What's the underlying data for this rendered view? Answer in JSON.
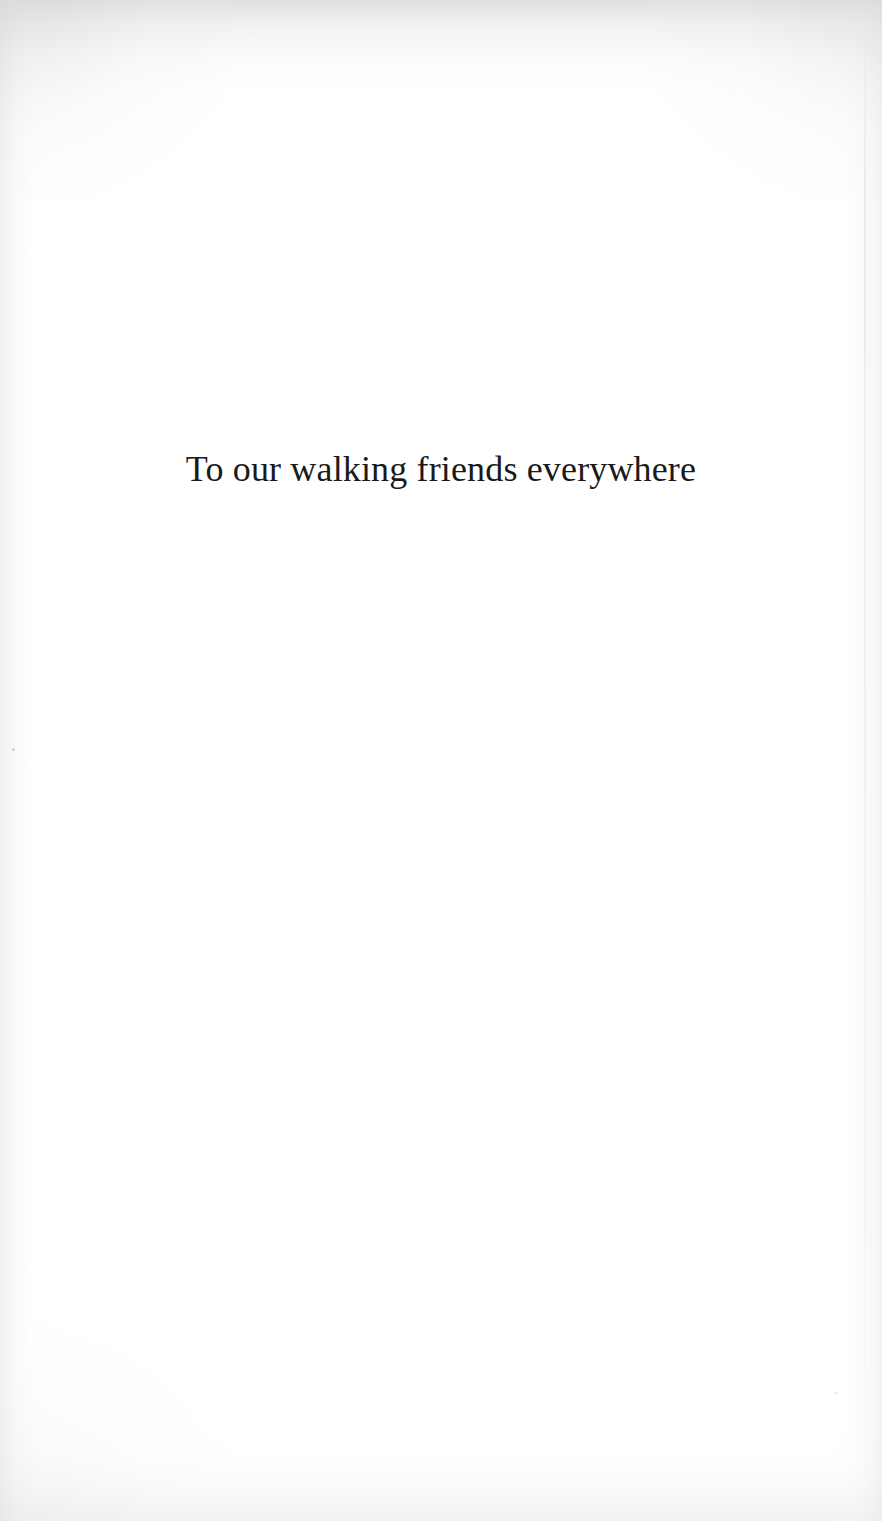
{
  "page": {
    "kind": "book-dedication-page",
    "width": 882,
    "height": 1521,
    "background_color": "#ffffff",
    "text_color": "#1a1a1a",
    "edge_shadow_color": "#e8e8e8"
  },
  "dedication": {
    "text": "To our walking friends everywhere"
  }
}
